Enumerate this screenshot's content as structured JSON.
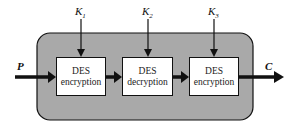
{
  "diagram": {
    "input_label": "P",
    "output_label": "C",
    "keys": [
      "K1",
      "K2",
      "K3"
    ],
    "key_labels": [
      {
        "base": "K",
        "sub": "1"
      },
      {
        "base": "K",
        "sub": "2"
      },
      {
        "base": "K",
        "sub": "3"
      }
    ],
    "blocks": [
      {
        "line1": "DES",
        "line2": "encryption"
      },
      {
        "line1": "DES",
        "line2": "decryption"
      },
      {
        "line1": "DES",
        "line2": "encryption"
      }
    ],
    "colors": {
      "container": "#a9a9a9",
      "stroke": "#111111",
      "block_fill": "#ffffff"
    }
  }
}
